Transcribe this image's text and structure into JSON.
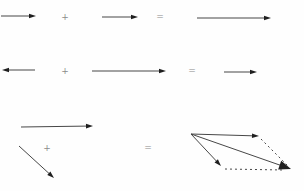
{
  "canvas": {
    "width": 304,
    "height": 191,
    "background": "#fefefe",
    "line_color": "#474747",
    "arrowhead_color": "#1f1f1f",
    "operator_color": "#8a8a8a",
    "dash_pattern": "2 3"
  },
  "diagram": {
    "head_sizes": {
      "small": {
        "l": 7,
        "w": 2.3
      },
      "large": {
        "l": 12,
        "w": 4.6
      }
    },
    "vectors": [
      {
        "name": "row1-vector-a",
        "x1": 1,
        "y1": 16,
        "x2": 36,
        "y2": 16,
        "head": "small"
      },
      {
        "name": "row1-vector-b",
        "x1": 102,
        "y1": 17,
        "x2": 138,
        "y2": 17,
        "head": "small"
      },
      {
        "name": "row1-resultant-vector",
        "x1": 197,
        "y1": 18,
        "x2": 271,
        "y2": 18,
        "head": "small"
      },
      {
        "name": "row2-vector-a-leftward",
        "x1": 35,
        "y1": 70,
        "x2": 2,
        "y2": 70,
        "head": "small"
      },
      {
        "name": "row2-vector-b",
        "x1": 92,
        "y1": 71,
        "x2": 166,
        "y2": 71,
        "head": "small"
      },
      {
        "name": "row2-resultant-vector",
        "x1": 224,
        "y1": 72,
        "x2": 257,
        "y2": 72,
        "head": "small"
      },
      {
        "name": "row3-vector-a-horizontal",
        "x1": 21,
        "y1": 127,
        "x2": 93,
        "y2": 126,
        "head": "small"
      },
      {
        "name": "row3-vector-b-diagonal",
        "x1": 19,
        "y1": 146,
        "x2": 54,
        "y2": 178,
        "head": "small"
      },
      {
        "name": "parallelogram-top-vector",
        "x1": 191,
        "y1": 134,
        "x2": 259,
        "y2": 136,
        "head": "small"
      },
      {
        "name": "parallelogram-side-vector",
        "x1": 191,
        "y1": 134,
        "x2": 221,
        "y2": 166,
        "head": "small"
      },
      {
        "name": "parallelogram-resultant-vector",
        "x1": 191,
        "y1": 134,
        "x2": 291,
        "y2": 169,
        "head": "large"
      }
    ],
    "dashed_lines": [
      {
        "name": "parallelogram-dashed-right-side",
        "x1": 261,
        "y1": 139,
        "x2": 288,
        "y2": 166
      },
      {
        "name": "parallelogram-dashed-bottom-side",
        "x1": 225,
        "y1": 169,
        "x2": 284,
        "y2": 170
      }
    ],
    "operators": [
      {
        "name": "row1-plus-sign",
        "text": "+",
        "x": 65,
        "y": 17
      },
      {
        "name": "row1-equals-sign",
        "text": "=",
        "x": 160,
        "y": 17
      },
      {
        "name": "row2-plus-sign",
        "text": "+",
        "x": 65,
        "y": 71
      },
      {
        "name": "row2-equals-sign",
        "text": "=",
        "x": 192,
        "y": 71
      },
      {
        "name": "row3-plus-sign",
        "text": "+",
        "x": 47,
        "y": 148
      },
      {
        "name": "row3-equals-sign",
        "text": "=",
        "x": 148,
        "y": 148
      }
    ]
  }
}
